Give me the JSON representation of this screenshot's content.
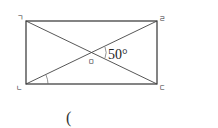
{
  "diagram": {
    "type": "rectangle-with-diagonals",
    "vertices": {
      "top_left": "ㄱ",
      "top_right": "ㄹ",
      "bottom_left": "ㄴ",
      "bottom_right": "ㄷ",
      "intersection": "ㅁ"
    },
    "angle_label": "50°",
    "answer_blank": "("
  }
}
